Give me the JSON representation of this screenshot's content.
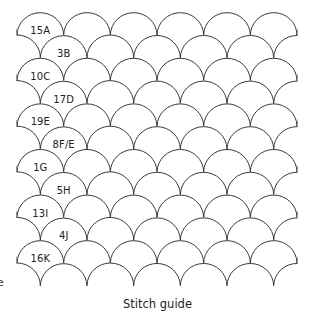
{
  "figure": {
    "caption": "Stitch guide",
    "pattern": {
      "type": "clamshell-scales",
      "stroke_color": "#3a3a3a",
      "stroke_width": 1,
      "left_edge_x": 17,
      "right_edge_x": 297,
      "first_cusp_y": 35,
      "row_step_y": 22.8,
      "scale_width": 46.67,
      "half_rows": 12,
      "scales_per_row": 6
    },
    "labels": [
      {
        "text": "15A",
        "row": 0
      },
      {
        "text": "3B",
        "row": 1
      },
      {
        "text": "10C",
        "row": 2
      },
      {
        "text": "17D",
        "row": 3
      },
      {
        "text": "19E",
        "row": 4
      },
      {
        "text": "8F/E",
        "row": 5
      },
      {
        "text": "1G",
        "row": 6
      },
      {
        "text": "5H",
        "row": 7
      },
      {
        "text": "13I",
        "row": 8
      },
      {
        "text": "4J",
        "row": 9
      },
      {
        "text": "16K",
        "row": 10
      }
    ],
    "edge_fragments": [
      {
        "text": ".",
        "y": 256
      },
      {
        "text": "e",
        "y": 277
      }
    ]
  }
}
